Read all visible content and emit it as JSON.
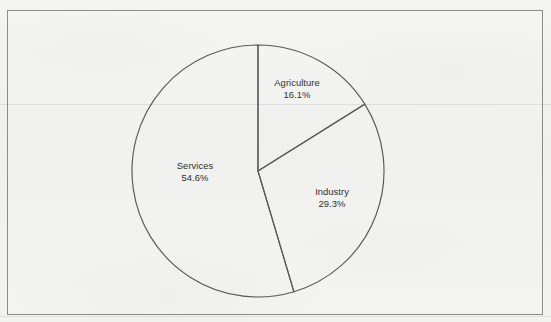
{
  "document": {
    "type": "scanned-page",
    "frame_border_color": "#8c8c8c",
    "paper_color": "#f1f1ef",
    "line_color": "#595959",
    "label_color": "#2e2e2e"
  },
  "chart_data": {
    "type": "pie",
    "title": "",
    "subtitle": "",
    "xlabel": "",
    "ylabel": "",
    "grid": false,
    "legend": "none",
    "labels_inside": true,
    "start_angle_deg": 0,
    "direction": "clockwise",
    "center": {
      "x": 258,
      "y": 171
    },
    "radius": 126,
    "categories": [
      "Agriculture",
      "Industry",
      "Services"
    ],
    "values": [
      16.1,
      29.3,
      54.6
    ],
    "unit": "%",
    "slices": [
      {
        "name": "Agriculture",
        "value": 16.1,
        "value_text": "16.1%",
        "start_pct": 0.0,
        "end_pct": 16.1,
        "fill": "none",
        "label": {
          "name": "Agriculture",
          "value_text": "16.1%"
        }
      },
      {
        "name": "Industry",
        "value": 29.3,
        "value_text": "29.3%",
        "start_pct": 16.1,
        "end_pct": 45.4,
        "fill": "none",
        "label": {
          "name": "Industry",
          "value_text": "29.3%"
        }
      },
      {
        "name": "Services",
        "value": 54.6,
        "value_text": "54.6%",
        "start_pct": 45.4,
        "end_pct": 100.0,
        "fill": "none",
        "label": {
          "name": "Services",
          "value_text": "54.6%"
        }
      }
    ]
  }
}
